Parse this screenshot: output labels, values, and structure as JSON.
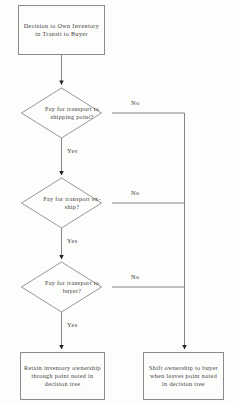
{
  "diagram": {
    "title": "Decision to Own Inventory in Transit to Buyer",
    "type": "flowchart",
    "background_color": "#fdfdfb",
    "line_color": "#8a8a8a",
    "text_color": "#3b3b3b"
  },
  "start_node": {
    "id": "start",
    "shape": "rectangle",
    "label": "Decision to Own Inventory in Transit to Buyer"
  },
  "decisions": [
    {
      "id": "decision-shipping-point",
      "shape": "diamond",
      "label": "Pay for transport to shipping point?",
      "yes_label": "Yes",
      "no_label": "No"
    },
    {
      "id": "decision-ex-ship",
      "shape": "diamond",
      "label": "Pay for transport ex-ship?",
      "yes_label": "Yes",
      "no_label": "No"
    },
    {
      "id": "decision-to-buyer",
      "shape": "diamond",
      "label": "Pay for transport to buyer?",
      "yes_label": "Yes",
      "no_label": "No"
    }
  ],
  "outcomes": [
    {
      "id": "outcome-retain",
      "shape": "rectangle",
      "label": "Retain inventory ownership through point noted in decision tree"
    },
    {
      "id": "outcome-shift",
      "shape": "rectangle",
      "label": "Shift ownership to buyer when leaves point noted in decision tree"
    }
  ]
}
